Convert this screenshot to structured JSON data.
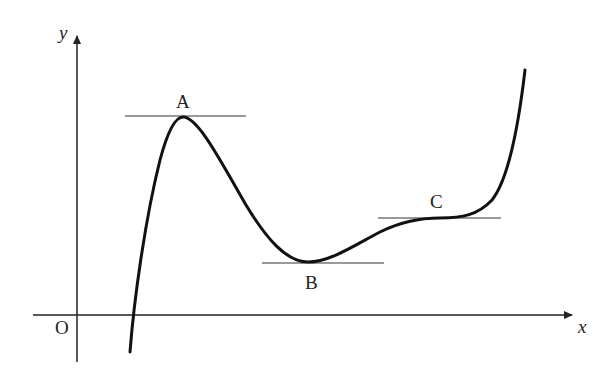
{
  "diagram": {
    "axes": {
      "x_label": "x",
      "y_label": "y",
      "origin_label": "O"
    },
    "points": [
      {
        "id": "A",
        "label": "A",
        "type": "local maximum",
        "tangent": "horizontal"
      },
      {
        "id": "B",
        "label": "B",
        "type": "local minimum",
        "tangent": "horizontal"
      },
      {
        "id": "C",
        "label": "C",
        "type": "horizontal point of inflection",
        "tangent": "horizontal"
      }
    ],
    "colors": {
      "curve": "#111111",
      "axes": "#222222",
      "tangents": "#777777",
      "background": "#ffffff"
    }
  }
}
